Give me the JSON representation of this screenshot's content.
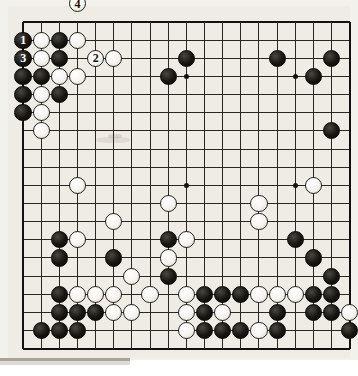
{
  "board": {
    "type": "go-board",
    "size": 19,
    "grid_origin_x": 15,
    "grid_origin_y": 16,
    "grid_spacing": 18.15,
    "stone_radius": 8.6,
    "star_points": [
      [
        3,
        3
      ],
      [
        9,
        3
      ],
      [
        15,
        3
      ],
      [
        3,
        9
      ],
      [
        9,
        9
      ],
      [
        15,
        9
      ],
      [
        3,
        15
      ],
      [
        9,
        15
      ],
      [
        15,
        15
      ]
    ],
    "colors": {
      "board_bg": "#efece5",
      "line": "#2a2723",
      "edge_line": "#141210",
      "black_stone": "#141210",
      "white_stone": "#f8f6f1",
      "page_bg": "#ffffff"
    },
    "numbered_moves": [
      {
        "number": "1",
        "color": "black",
        "col": 0,
        "row": 1
      },
      {
        "number": "2",
        "color": "white",
        "col": 4,
        "row": 2
      },
      {
        "number": "3",
        "color": "black",
        "col": 0,
        "row": 2
      },
      {
        "number": "4",
        "color": "white",
        "col": 3,
        "row": -1
      }
    ],
    "black_stones": [
      [
        2,
        1
      ],
      [
        2,
        2
      ],
      [
        0,
        3
      ],
      [
        1,
        3
      ],
      [
        0,
        4
      ],
      [
        2,
        4
      ],
      [
        0,
        5
      ],
      [
        9,
        2
      ],
      [
        14,
        2
      ],
      [
        17,
        2
      ],
      [
        8,
        3
      ],
      [
        16,
        3
      ],
      [
        17,
        6
      ],
      [
        2,
        12
      ],
      [
        8,
        12
      ],
      [
        15,
        12
      ],
      [
        2,
        13
      ],
      [
        5,
        13
      ],
      [
        16,
        13
      ],
      [
        8,
        14
      ],
      [
        17,
        14
      ],
      [
        2,
        15
      ],
      [
        10,
        15
      ],
      [
        11,
        15
      ],
      [
        12,
        15
      ],
      [
        16,
        15
      ],
      [
        17,
        15
      ],
      [
        2,
        16
      ],
      [
        3,
        16
      ],
      [
        4,
        16
      ],
      [
        10,
        16
      ],
      [
        14,
        16
      ],
      [
        16,
        16
      ],
      [
        17,
        16
      ],
      [
        1,
        17
      ],
      [
        2,
        17
      ],
      [
        3,
        17
      ],
      [
        10,
        17
      ],
      [
        11,
        17
      ],
      [
        12,
        17
      ],
      [
        14,
        17
      ],
      [
        18,
        17
      ]
    ],
    "white_stones": [
      [
        1,
        1
      ],
      [
        3,
        1
      ],
      [
        1,
        2
      ],
      [
        5,
        2
      ],
      [
        2,
        3
      ],
      [
        3,
        3
      ],
      [
        1,
        4
      ],
      [
        1,
        5
      ],
      [
        1,
        6
      ],
      [
        3,
        9
      ],
      [
        8,
        10
      ],
      [
        13,
        10
      ],
      [
        16,
        9
      ],
      [
        5,
        11
      ],
      [
        13,
        11
      ],
      [
        3,
        12
      ],
      [
        8,
        12,
        "dup"
      ],
      [
        9,
        12
      ],
      [
        8,
        13
      ],
      [
        6,
        14
      ],
      [
        7,
        15
      ],
      [
        3,
        15
      ],
      [
        4,
        15
      ],
      [
        5,
        15
      ],
      [
        9,
        15
      ],
      [
        13,
        15
      ],
      [
        14,
        15
      ],
      [
        15,
        15
      ],
      [
        16,
        15,
        "dup"
      ],
      [
        5,
        16
      ],
      [
        6,
        16
      ],
      [
        9,
        16
      ],
      [
        11,
        16
      ],
      [
        18,
        16
      ],
      [
        9,
        17
      ],
      [
        13,
        17
      ]
    ],
    "smudges": [
      {
        "x": 88,
        "y": 131,
        "w": 34,
        "h": 6,
        "opacity": 0.3
      },
      {
        "x": 100,
        "y": 128,
        "w": 14,
        "h": 4,
        "opacity": 0.45
      }
    ]
  }
}
